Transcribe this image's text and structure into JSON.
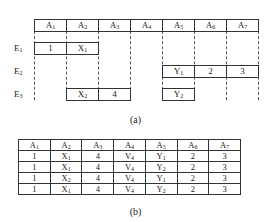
{
  "diagram_a": {
    "attributes": [
      {
        "name": "A",
        "sub": "1"
      },
      {
        "name": "A",
        "sub": "2"
      },
      {
        "name": "A",
        "sub": "3"
      },
      {
        "name": "A",
        "sub": "4"
      },
      {
        "name": "A",
        "sub": "5"
      },
      {
        "name": "A",
        "sub": "6"
      },
      {
        "name": "A",
        "sub": "7"
      }
    ],
    "entities": [
      {
        "label": "E",
        "sub": "1",
        "cells": [
          {
            "col": 0,
            "text": "1",
            "sub": ""
          },
          {
            "col": 1,
            "text": "X",
            "sub": "1"
          }
        ]
      },
      {
        "label": "E",
        "sub": "2",
        "cells": [
          {
            "col": 4,
            "text": "Y",
            "sub": "1"
          },
          {
            "col": 5,
            "text": "2",
            "sub": ""
          },
          {
            "col": 6,
            "text": "3",
            "sub": ""
          }
        ]
      },
      {
        "label": "E",
        "sub": "3",
        "cells": [
          {
            "col": 1,
            "text": "X",
            "sub": "2"
          },
          {
            "col": 2,
            "text": "4",
            "sub": ""
          },
          {
            "col": 4,
            "text": "Y",
            "sub": "2"
          }
        ]
      }
    ],
    "caption": "(a)"
  },
  "table_b": {
    "headers": [
      {
        "name": "A",
        "sub": "1"
      },
      {
        "name": "A",
        "sub": "2"
      },
      {
        "name": "A",
        "sub": "3"
      },
      {
        "name": "A",
        "sub": "4"
      },
      {
        "name": "A",
        "sub": "5"
      },
      {
        "name": "A",
        "sub": "6"
      },
      {
        "name": "A",
        "sub": "7"
      }
    ],
    "rows": [
      [
        {
          "t": "1",
          "s": ""
        },
        {
          "t": "X",
          "s": "1"
        },
        {
          "t": "4",
          "s": ""
        },
        {
          "t": "V",
          "s": "4"
        },
        {
          "t": "Y",
          "s": "1"
        },
        {
          "t": "2",
          "s": ""
        },
        {
          "t": "3",
          "s": ""
        }
      ],
      [
        {
          "t": "1",
          "s": ""
        },
        {
          "t": "X",
          "s": "1"
        },
        {
          "t": "4",
          "s": ""
        },
        {
          "t": "V",
          "s": "4"
        },
        {
          "t": "Y",
          "s": "2"
        },
        {
          "t": "2",
          "s": ""
        },
        {
          "t": "3",
          "s": ""
        }
      ],
      [
        {
          "t": "1",
          "s": ""
        },
        {
          "t": "X",
          "s": "2"
        },
        {
          "t": "4",
          "s": ""
        },
        {
          "t": "V",
          "s": "4"
        },
        {
          "t": "Y",
          "s": "1"
        },
        {
          "t": "2",
          "s": ""
        },
        {
          "t": "3",
          "s": ""
        }
      ],
      [
        {
          "t": "1",
          "s": ""
        },
        {
          "t": "X",
          "s": "1"
        },
        {
          "t": "4",
          "s": ""
        },
        {
          "t": "V",
          "s": "4"
        },
        {
          "t": "Y",
          "s": "2"
        },
        {
          "t": "2",
          "s": ""
        },
        {
          "t": "3",
          "s": ""
        }
      ]
    ],
    "caption": "(b)"
  }
}
